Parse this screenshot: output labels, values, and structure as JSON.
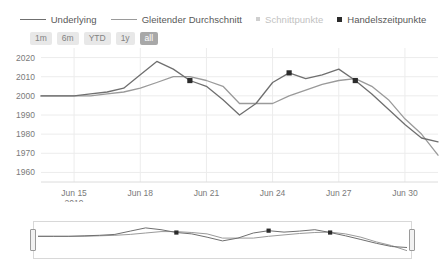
{
  "legend": {
    "items": [
      {
        "label": "Underlying",
        "marker": "line-dark",
        "color": "#6f6f6f"
      },
      {
        "label": "Gleitender Durchschnitt",
        "marker": "line-light",
        "color": "#9a9a9a"
      },
      {
        "label": "Schnittpunkte",
        "marker": "dot",
        "color": "#cfcfcf"
      },
      {
        "label": "Handelszeitpunkte",
        "marker": "square",
        "color": "#2b2b2b"
      }
    ]
  },
  "ranges": {
    "buttons": [
      {
        "label": "1m",
        "active": false
      },
      {
        "label": "6m",
        "active": false
      },
      {
        "label": "YTD",
        "active": false
      },
      {
        "label": "1y",
        "active": false
      },
      {
        "label": "all",
        "active": true
      }
    ]
  },
  "navigator": {
    "left_handle": "navigator-left-handle",
    "right_handle": "navigator-right-handle"
  },
  "chart_data": {
    "type": "line",
    "title": "",
    "xlabel": "",
    "ylabel": "",
    "ylim": [
      1955,
      2025
    ],
    "yticks": [
      1960,
      1970,
      1980,
      1990,
      2000,
      2010,
      2020
    ],
    "grid": true,
    "legend_position": "top",
    "xticklabels": [
      "Jun 15",
      "Jun 18",
      "Jun 21",
      "Jun 24",
      "Jun 27",
      "Jun 30"
    ],
    "xtick_sublabel": "2019",
    "x": [
      0,
      1,
      2,
      3,
      4,
      5,
      6,
      7,
      8,
      9,
      10,
      11,
      12,
      13,
      14,
      15,
      16,
      17,
      18,
      19,
      20,
      21,
      22,
      23,
      24
    ],
    "series": [
      {
        "name": "Underlying",
        "color": "#6f6f6f",
        "values": [
          2000,
          2000,
          2000,
          2001,
          2002,
          2004,
          2011,
          2018,
          2014,
          2008,
          2005,
          1998,
          1990,
          1996,
          2007,
          2012,
          2009,
          2011,
          2014,
          2008,
          2001,
          1993,
          1985,
          1978,
          1976
        ]
      },
      {
        "name": "Gleitender Durchschnitt",
        "color": "#9a9a9a",
        "values": [
          2000,
          2000,
          2000,
          2000,
          2001,
          2002,
          2004,
          2007,
          2010,
          2010,
          2008,
          2005,
          1996,
          1996,
          1996,
          2000,
          2003,
          2006,
          2008,
          2009,
          2005,
          1998,
          1988,
          1980,
          1969
        ]
      }
    ],
    "markers": [
      {
        "name": "Handelszeitpunkte",
        "x": 9,
        "y": 2008
      },
      {
        "name": "Handelszeitpunkte",
        "x": 15,
        "y": 2012
      },
      {
        "name": "Handelszeitpunkte",
        "x": 19,
        "y": 2008
      }
    ],
    "navigator_series": [
      {
        "name": "Underlying",
        "color": "#6f6f6f",
        "values": [
          2000,
          2000,
          2000,
          2001,
          2002,
          2004,
          2011,
          2018,
          2014,
          2008,
          2005,
          1998,
          1990,
          1996,
          2007,
          2012,
          2009,
          2011,
          2014,
          2008,
          2001,
          1993,
          1985,
          1978,
          1976
        ]
      },
      {
        "name": "Gleitender Durchschnitt",
        "color": "#9a9a9a",
        "values": [
          2000,
          2000,
          2000,
          2000,
          2001,
          2002,
          2004,
          2007,
          2010,
          2010,
          2008,
          2005,
          1996,
          1996,
          1996,
          2000,
          2003,
          2006,
          2008,
          2009,
          2005,
          1998,
          1988,
          1980,
          1969
        ]
      }
    ],
    "navigator_markers": [
      {
        "x": 9,
        "y": 2008
      },
      {
        "x": 15,
        "y": 2012
      },
      {
        "x": 19,
        "y": 2008
      }
    ]
  }
}
